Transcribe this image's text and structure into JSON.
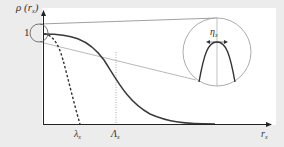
{
  "figure": {
    "y_axis_label": "ρ",
    "y_axis_arg_open": "(",
    "y_axis_arg": "r",
    "y_axis_arg_sub": "x",
    "y_axis_arg_close": ")",
    "y_tick_one": "1",
    "x_axis_label": "r",
    "x_axis_label_sub": "x",
    "marker_lambda_small": "λ",
    "marker_lambda_small_sub": "x",
    "marker_lambda_big": "Λ",
    "marker_lambda_big_sub": "x",
    "inset_label": "η",
    "inset_label_sub": "x"
  },
  "colors": {
    "background": "#ececec",
    "plot_area": "#ffffff",
    "curve": "#3a3a3a",
    "guide": "#888888"
  }
}
